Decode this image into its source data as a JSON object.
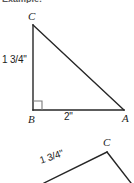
{
  "document": {
    "clipped_caption": "Example:",
    "background_color": "#ffffff",
    "stroke_color": "#262626"
  },
  "figures": [
    {
      "id": "triangle-1",
      "type": "right-triangle",
      "vertices": {
        "C": {
          "label": "C",
          "x": 33,
          "y": 25
        },
        "B": {
          "label": "B",
          "x": 33,
          "y": 110
        },
        "A": {
          "label": "A",
          "x": 124,
          "y": 110
        }
      },
      "right_angle_at": "B",
      "measures": {
        "leg_BC": "1 3/4\"",
        "base_BA": "2\""
      }
    },
    {
      "id": "triangle-2",
      "type": "triangle-partial",
      "vertices": {
        "C": {
          "label": "C",
          "x": 107,
          "y": 152
        }
      },
      "measures": {
        "side": "1 3/4\""
      },
      "note_cropped": true
    }
  ],
  "labels": {
    "t1_vertex_c": "C",
    "t1_vertex_b": "B",
    "t1_vertex_a": "A",
    "t1_leg": "1 3/4\"",
    "t1_base": "2\"",
    "t2_vertex_c": "C",
    "t2_side": "1 3/4\""
  }
}
